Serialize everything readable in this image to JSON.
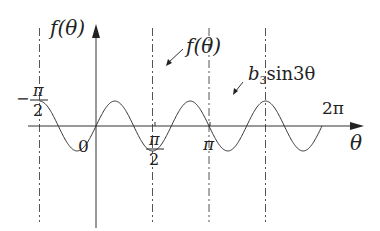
{
  "chart_data": {
    "type": "line",
    "title": "",
    "xlabel": "θ",
    "ylabel": "f(θ)",
    "xlim": [
      -1.5708,
      6.5
    ],
    "ylim": [
      -1.6,
      1.6
    ],
    "x_ticks": [
      {
        "value": -1.5708,
        "num": "π",
        "den": "2",
        "sign": "−"
      },
      {
        "value": 0,
        "label": "0"
      },
      {
        "value": 1.5708,
        "num": "π",
        "den": "2",
        "sign": ""
      },
      {
        "value": 3.1416,
        "label": "π"
      },
      {
        "value": 6.2832,
        "label": "2π"
      }
    ],
    "series": [
      {
        "name": "f(θ)",
        "label": "f(θ)",
        "style": "thick",
        "description": "odd, 2π-periodic cusped curve: rises from −1.4 at −π/2 through 0 to a cusp peak 1.4 at π/2, falls through 0 at π to a cusp trough −1.4 at 3π/2, returns to 0 at 2π",
        "peak": {
          "x": 1.5708,
          "y": 1.4
        },
        "trough": {
          "x": 4.7124,
          "y": -1.4
        },
        "start": {
          "x": -1.5708,
          "y": -1.4
        },
        "end": {
          "x": 6.2832,
          "y": 0
        }
      },
      {
        "name": "b3 sin 3θ",
        "label_main": "b",
        "label_sub": "3",
        "label_rest": "sin3θ",
        "style": "thin",
        "amplitude": 0.48,
        "frequency": 3,
        "x_range": [
          -1.5708,
          6.2832
        ]
      }
    ],
    "guides": [
      {
        "x": -1.5708,
        "style": "dash-dot"
      },
      {
        "x": 1.5708,
        "style": "dash-dot"
      },
      {
        "x": 3.1416,
        "style": "dash-dot"
      },
      {
        "x": 4.7124,
        "style": "dash-dot"
      }
    ]
  },
  "labels": {
    "y_axis": "f(θ)",
    "x_axis": "θ",
    "f_curve": "f(θ)",
    "sine_b": "b",
    "sine_sub": "3",
    "sine_rest": "sin3θ",
    "tick_zero": "0",
    "tick_pi": "π",
    "tick_2pi": "2π",
    "tick_pi_half_num": "π",
    "tick_pi_half_den": "2",
    "tick_neg_sign": "−",
    "tick_neg_num": "π",
    "tick_neg_den": "2"
  }
}
